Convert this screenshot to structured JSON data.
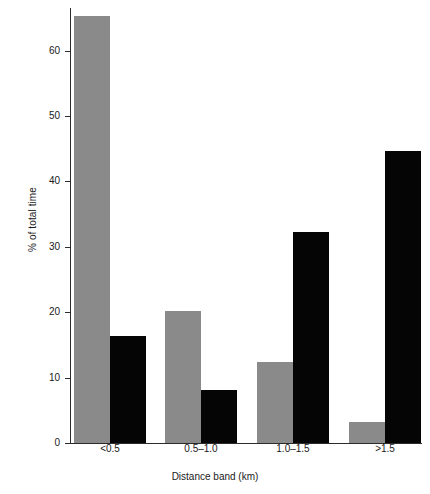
{
  "chart_data": {
    "type": "bar",
    "title": "",
    "subtitle": "",
    "xlabel": "Distance band (km)",
    "ylabel": "% of total time",
    "categories": [
      "<0.5",
      "0.5–1.0",
      "1.0–1.5",
      ">1.5"
    ],
    "series": [
      {
        "name": "grey-series",
        "color": "#8a8a8a",
        "values": [
          65.3,
          20.2,
          12.4,
          3.2
        ]
      },
      {
        "name": "black-series",
        "color": "#050505",
        "values": [
          16.4,
          8.1,
          32.3,
          44.6
        ]
      }
    ],
    "ylim": [
      0,
      66.5
    ],
    "yticks": [
      0,
      10,
      20,
      30,
      40,
      50,
      60
    ],
    "ytick_labels": [
      "0",
      "10",
      "20",
      "30",
      "40",
      "50",
      "60"
    ],
    "grid": false,
    "legend": "none",
    "axis_color": "#2b2b2b",
    "background": "#ffffff"
  }
}
